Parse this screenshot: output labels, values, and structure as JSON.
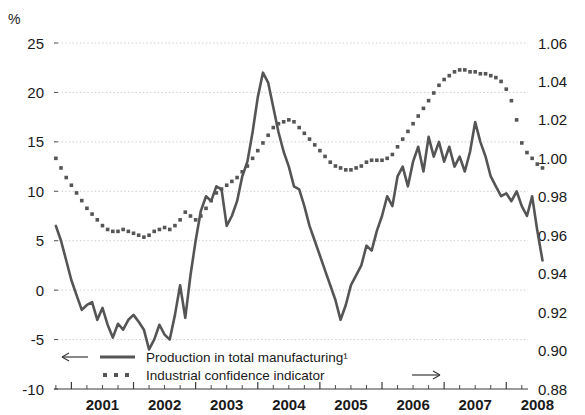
{
  "figure": {
    "unit_label": "%",
    "title_fragment": ""
  },
  "legend": {
    "items": [
      {
        "label": "Production in total manufacturing¹",
        "marker": "solid-line",
        "axis_arrow": "left-arrow-icon",
        "color": "#555555"
      },
      {
        "label": "Industrial confidence indicator",
        "marker": "dotted-squares",
        "axis_arrow": "right-arrow-icon",
        "color": "#555555"
      }
    ]
  },
  "chart_data": {
    "type": "line",
    "title": "",
    "xlabel": "",
    "ylabel": "%",
    "grid": true,
    "legend_position": "bottom-left",
    "x": [
      2000.75,
      2000.833,
      2000.917,
      2001.0,
      2001.083,
      2001.167,
      2001.25,
      2001.333,
      2001.417,
      2001.5,
      2001.583,
      2001.667,
      2001.75,
      2001.833,
      2001.917,
      2002.0,
      2002.083,
      2002.167,
      2002.25,
      2002.333,
      2002.417,
      2002.5,
      2002.583,
      2002.667,
      2002.75,
      2002.833,
      2002.917,
      2003.0,
      2003.083,
      2003.167,
      2003.25,
      2003.333,
      2003.417,
      2003.5,
      2003.583,
      2003.667,
      2003.75,
      2003.833,
      2003.917,
      2004.0,
      2004.083,
      2004.167,
      2004.25,
      2004.333,
      2004.417,
      2004.5,
      2004.583,
      2004.667,
      2004.75,
      2004.833,
      2004.917,
      2005.0,
      2005.083,
      2005.167,
      2005.25,
      2005.333,
      2005.417,
      2005.5,
      2005.583,
      2005.667,
      2005.75,
      2005.833,
      2005.917,
      2006.0,
      2006.083,
      2006.167,
      2006.25,
      2006.333,
      2006.417,
      2006.5,
      2006.583,
      2006.667,
      2006.75,
      2006.833,
      2006.917,
      2007.0,
      2007.083,
      2007.167,
      2007.25,
      2007.333,
      2007.417,
      2007.5,
      2007.583,
      2007.667,
      2007.75,
      2007.833,
      2007.917,
      2008.0,
      2008.083,
      2008.167,
      2008.25
    ],
    "x_tick_labels": [
      "2001",
      "2002",
      "2003",
      "2004",
      "2005",
      "2006",
      "2007",
      "2008"
    ],
    "x_tick_values": [
      2001,
      2002,
      2003,
      2004,
      2005,
      2006,
      2007,
      2008
    ],
    "x_minor_ticks_per_year": 4,
    "xlim": [
      2000.72,
      2008.35
    ],
    "series": [
      {
        "name": "Production in total manufacturing¹",
        "axis": "left",
        "style": "solid",
        "color": "#555555",
        "width": 2.6,
        "ylabel": "%",
        "ylim": [
          -10,
          25
        ],
        "y_ticks": [
          -10,
          -5,
          0,
          5,
          10,
          15,
          20,
          25
        ],
        "y_tick_labels": [
          "-10",
          "-5",
          "0",
          "5",
          "10",
          "15",
          "20",
          "25"
        ],
        "values": [
          6.5,
          5.0,
          3.0,
          1.0,
          -0.5,
          -2.0,
          -1.5,
          -1.2,
          -3.0,
          -1.8,
          -3.5,
          -4.8,
          -3.4,
          -4.0,
          -3.0,
          -2.5,
          -3.2,
          -4.0,
          -6.0,
          -5.0,
          -3.5,
          -4.5,
          -5.0,
          -2.5,
          0.5,
          -2.8,
          1.5,
          5.0,
          8.0,
          9.5,
          9.0,
          10.5,
          10.2,
          6.5,
          7.5,
          9.0,
          11.5,
          13.0,
          16.0,
          19.5,
          22.0,
          21.0,
          18.5,
          16.0,
          14.0,
          12.5,
          10.5,
          10.2,
          8.5,
          6.5,
          5.0,
          3.5,
          2.0,
          0.5,
          -1.0,
          -3.0,
          -1.5,
          0.5,
          1.5,
          2.5,
          4.5,
          4.0,
          6.0,
          7.5,
          9.5,
          8.5,
          11.5,
          12.5,
          10.5,
          13.0,
          14.5,
          12.0,
          15.5,
          13.5,
          15.0,
          13.0,
          14.5,
          12.5,
          13.5,
          12.0,
          14.0,
          17.0,
          15.0,
          13.5,
          11.5,
          10.5,
          9.5,
          9.8,
          9.0,
          10.0,
          8.5
        ],
        "final_values_note": "falls to about 3 in mid 2008",
        "tail_values": [
          7.5,
          9.5,
          6.0,
          3.0
        ]
      },
      {
        "name": "Industrial confidence indicator",
        "axis": "right",
        "style": "dotted",
        "color": "#555555",
        "marker": "square",
        "ylim": [
          0.88,
          1.06
        ],
        "y_ticks": [
          0.88,
          0.9,
          0.92,
          0.94,
          0.96,
          0.98,
          1.0,
          1.02,
          1.04,
          1.06
        ],
        "y_tick_labels": [
          "0.88",
          "0.90",
          "0.92",
          "0.94",
          "0.96",
          "0.98",
          "1.00",
          "1.02",
          "1.04",
          "1.06"
        ],
        "values": [
          1.0,
          0.995,
          0.99,
          0.986,
          0.982,
          0.978,
          0.974,
          0.971,
          0.968,
          0.965,
          0.963,
          0.962,
          0.962,
          0.963,
          0.962,
          0.961,
          0.96,
          0.959,
          0.96,
          0.962,
          0.963,
          0.964,
          0.963,
          0.965,
          0.968,
          0.972,
          0.97,
          0.968,
          0.97,
          0.974,
          0.978,
          0.982,
          0.984,
          0.986,
          0.988,
          0.99,
          0.993,
          0.996,
          1.0,
          1.004,
          1.008,
          1.012,
          1.016,
          1.018,
          1.019,
          1.02,
          1.019,
          1.016,
          1.013,
          1.01,
          1.007,
          1.004,
          1.001,
          0.998,
          0.996,
          0.995,
          0.994,
          0.994,
          0.995,
          0.996,
          0.998,
          0.999,
          0.999,
          0.999,
          1.0,
          1.002,
          1.006,
          1.01,
          1.014,
          1.018,
          1.022,
          1.026,
          1.03,
          1.034,
          1.038,
          1.041,
          1.043,
          1.045,
          1.046,
          1.046,
          1.045,
          1.045,
          1.044,
          1.044,
          1.043,
          1.042,
          1.04,
          1.036,
          1.03,
          1.02,
          1.008
        ],
        "tail_values": [
          1.003,
          1.0,
          0.997,
          0.995
        ]
      }
    ]
  }
}
